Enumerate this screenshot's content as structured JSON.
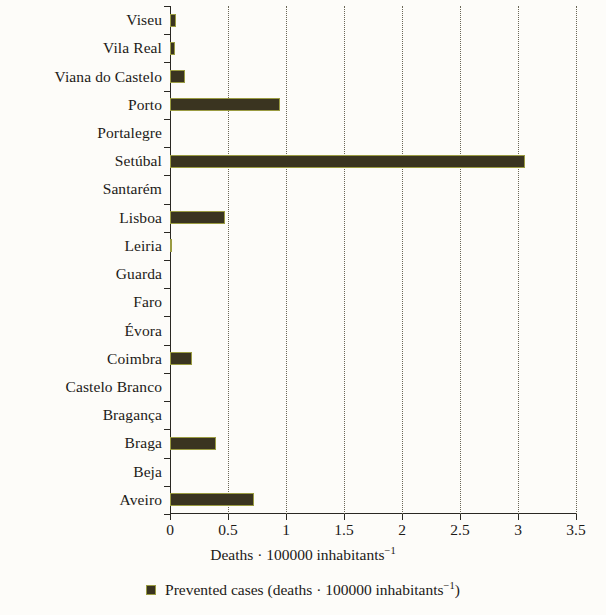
{
  "chart_data": {
    "type": "bar",
    "orientation": "horizontal",
    "title": "",
    "xlabel": "Deaths · 100000 inhabitants⁻¹",
    "ylabel": "",
    "xlim": [
      0,
      3.5
    ],
    "grid": "vertical-dotted",
    "legend_position": "bottom",
    "categories": [
      "Viseu",
      "Vila Real",
      "Viana do Castelo",
      "Porto",
      "Portalegre",
      "Setúbal",
      "Santarém",
      "Lisboa",
      "Leiria",
      "Guarda",
      "Faro",
      "Évora",
      "Coimbra",
      "Castelo Branco",
      "Bragança",
      "Braga",
      "Beja",
      "Aveiro"
    ],
    "values": [
      0.05,
      0.04,
      0.13,
      0.95,
      0.0,
      3.06,
      0.0,
      0.47,
      0.02,
      0.0,
      0.0,
      0.0,
      0.19,
      0.0,
      0.0,
      0.4,
      0.0,
      0.72
    ],
    "xticks": [
      0,
      0.5,
      1,
      1.5,
      2,
      2.5,
      3,
      3.5
    ],
    "xtick_labels": [
      "0",
      "0.5",
      "1",
      "1.5",
      "2",
      "2.5",
      "3",
      "3.5"
    ],
    "series": [
      {
        "name": "Prevented cases (deaths · 100000 inhabitants⁻¹)",
        "color": "#3a3420",
        "edge_color": "#9a9b42"
      }
    ]
  },
  "axis": {
    "x_title_parts": {
      "main": "Deaths · 100000 inhabitants",
      "exponent": "−1"
    }
  },
  "legend": {
    "items": [
      {
        "label_main": "Prevented cases (deaths · 100000 inhabitants",
        "label_exponent": "−1",
        "label_tail": ")",
        "swatch_color": "#3a3420"
      }
    ]
  },
  "colors": {
    "bar_fill": "#3a3420",
    "bar_edge": "#9a9b42",
    "axis": "#2a2823",
    "gridline": "#6b6757",
    "background": "#fdfcf9",
    "text": "#1c1a17"
  }
}
